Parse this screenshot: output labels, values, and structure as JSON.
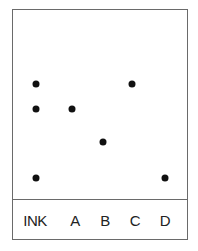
{
  "diagram": {
    "type": "chromatography-plate",
    "lanes": [
      {
        "label": "INK",
        "x": 36,
        "spots_y": [
          84,
          109,
          178
        ]
      },
      {
        "label": "A",
        "x": 72,
        "spots_y": [
          109
        ]
      },
      {
        "label": "B",
        "x": 103,
        "spots_y": [
          142
        ]
      },
      {
        "label": "C",
        "x": 132,
        "spots_y": [
          84
        ]
      },
      {
        "label": "D",
        "x": 165,
        "spots_y": [
          178
        ]
      }
    ],
    "label_x": [
      35,
      75,
      105,
      135,
      165
    ],
    "colors": {
      "border": "#6a6a6a",
      "spot": "#111111",
      "text": "#222222"
    }
  }
}
